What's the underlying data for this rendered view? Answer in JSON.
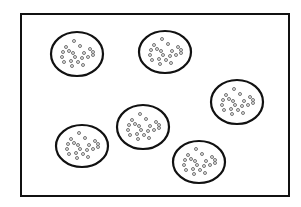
{
  "diagram": {
    "frame": {
      "x": 21,
      "y": 14,
      "width": 268,
      "height": 182,
      "stroke": "#111111",
      "stroke_width": 2
    },
    "ellipse_style": {
      "stroke": "#111111",
      "stroke_width": 2.2,
      "fill": "#ffffff"
    },
    "dot_style": {
      "r": 1.5,
      "stroke": "#666666",
      "stroke_width": 0.9,
      "fill": "#e6e6e6"
    },
    "dot_offsets": [
      [
        -3,
        -13
      ],
      [
        -11,
        -7
      ],
      [
        3,
        -8
      ],
      [
        13,
        -5
      ],
      [
        -14,
        -2
      ],
      [
        -8,
        -3
      ],
      [
        -4,
        -1
      ],
      [
        7,
        -1
      ],
      [
        16,
        -2
      ],
      [
        -15,
        3
      ],
      [
        -2,
        3
      ],
      [
        5,
        4
      ],
      [
        11,
        3
      ],
      [
        16,
        1
      ],
      [
        -13,
        8
      ],
      [
        -6,
        7
      ],
      [
        1,
        8
      ],
      [
        -5,
        12
      ],
      [
        6,
        11
      ]
    ],
    "clusters": [
      {
        "id": "cluster-1",
        "cx": 77,
        "cy": 54,
        "rx": 26,
        "ry": 22
      },
      {
        "id": "cluster-2",
        "cx": 165,
        "cy": 52,
        "rx": 26,
        "ry": 21
      },
      {
        "id": "cluster-3",
        "cx": 237,
        "cy": 102,
        "rx": 26,
        "ry": 22
      },
      {
        "id": "cluster-4",
        "cx": 143,
        "cy": 127,
        "rx": 26,
        "ry": 22
      },
      {
        "id": "cluster-5",
        "cx": 82,
        "cy": 146,
        "rx": 26,
        "ry": 21
      },
      {
        "id": "cluster-6",
        "cx": 199,
        "cy": 162,
        "rx": 26,
        "ry": 21
      }
    ]
  }
}
